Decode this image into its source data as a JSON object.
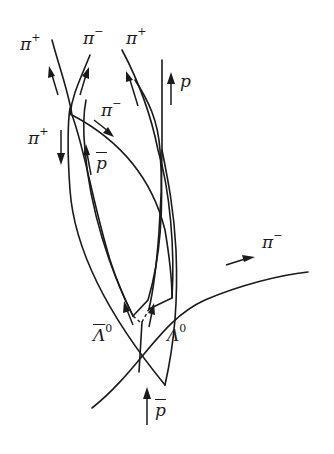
{
  "diagram": {
    "type": "bubble-chamber track sketch",
    "labels": {
      "pi_plus_top_left": {
        "symbol": "π",
        "charge": "+"
      },
      "pi_minus_top": {
        "symbol": "π",
        "charge": "−"
      },
      "pi_plus_top_right": {
        "symbol": "π",
        "charge": "+"
      },
      "proton": {
        "symbol": "p",
        "charge": ""
      },
      "pi_minus_mid": {
        "symbol": "π",
        "charge": "−"
      },
      "pi_plus_left": {
        "symbol": "π",
        "charge": "+"
      },
      "antiproton_mid": {
        "symbol": "p",
        "charge": "",
        "bar": true
      },
      "pi_minus_right": {
        "symbol": "π",
        "charge": "−"
      },
      "antilambda": {
        "symbol": "Λ",
        "charge": "0",
        "bar": true
      },
      "lambda": {
        "symbol": "Λ",
        "charge": "0"
      },
      "antiproton_beam": {
        "symbol": "p",
        "charge": "",
        "bar": true
      }
    }
  }
}
